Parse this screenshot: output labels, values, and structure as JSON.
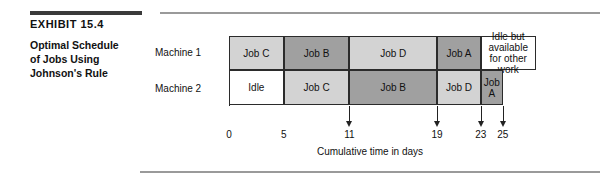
{
  "exhibit": {
    "number": "EXHIBIT 15.4",
    "title_lines": [
      "Optimal Schedule",
      "of Jobs Using",
      "Johnson's Rule"
    ]
  },
  "colors": {
    "light_gray": "#d3d3d3",
    "medium_gray": "#b9b9b9",
    "dark_gray": "#a0a0a0",
    "white": "#ffffff",
    "border": "#2b2b2b",
    "rule_dark": "#3a3a3a",
    "rule_light": "#9a9a9a"
  },
  "chart_data": {
    "type": "bar",
    "title": "Optimal Schedule of Jobs Using Johnson's Rule",
    "xlabel": "Cumulative time in days",
    "ylabel": "",
    "xlim": [
      0,
      28
    ],
    "grid": false,
    "legend": "none",
    "tick_labels": [
      "0",
      "5",
      "11",
      "19",
      "23",
      "25"
    ],
    "tick_values": [
      0,
      5,
      11,
      19,
      23,
      25
    ],
    "arrow_ticks": [
      11,
      19,
      23,
      25
    ],
    "categories": [
      "Machine 1",
      "Machine 2"
    ],
    "series": [
      {
        "name": "Machine 1",
        "row_label": "Machine 1",
        "blocks": [
          {
            "label": "Job C",
            "start": 0,
            "end": 5,
            "duration": 5,
            "shade": "light"
          },
          {
            "label": "Job B",
            "start": 5,
            "end": 11,
            "duration": 6,
            "shade": "dark"
          },
          {
            "label": "Job D",
            "start": 11,
            "end": 19,
            "duration": 8,
            "shade": "light"
          },
          {
            "label": "Job A",
            "start": 19,
            "end": 23,
            "duration": 4,
            "shade": "dark"
          },
          {
            "label": "Idle but available for other work",
            "start": 23,
            "end": 28,
            "duration": 5,
            "shade": "white"
          }
        ]
      },
      {
        "name": "Machine 2",
        "row_label": "Machine 2",
        "blocks": [
          {
            "label": "Idle",
            "start": 0,
            "end": 5,
            "duration": 5,
            "shade": "white"
          },
          {
            "label": "Job C",
            "start": 5,
            "end": 11,
            "duration": 6,
            "shade": "light"
          },
          {
            "label": "Job B",
            "start": 11,
            "end": 19,
            "duration": 8,
            "shade": "dark"
          },
          {
            "label": "Job D",
            "start": 19,
            "end": 23,
            "duration": 4,
            "shade": "light"
          },
          {
            "label": "Job A",
            "start": 23,
            "end": 25,
            "duration": 2,
            "shade": "dark"
          }
        ]
      }
    ]
  }
}
